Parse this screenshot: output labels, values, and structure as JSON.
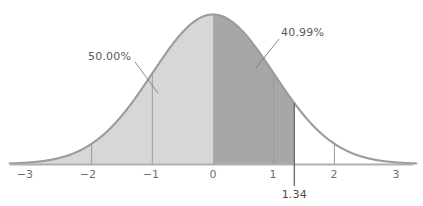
{
  "chart_data": {
    "type": "area",
    "title": "",
    "subtitle": "",
    "xlabel": "",
    "ylabel": "",
    "xlim": [
      -3.35,
      3.35
    ],
    "ylim": [
      0,
      0.4
    ],
    "grid": false,
    "legend": null,
    "distribution": "standard normal (z) curve, mean 0, sd 1",
    "x_ticks": [
      {
        "value": -3,
        "label": "−3"
      },
      {
        "value": -2,
        "label": "−2"
      },
      {
        "value": -1,
        "label": "−1"
      },
      {
        "value": 0,
        "label": "0"
      },
      {
        "value": 1,
        "label": "1"
      },
      {
        "value": 2,
        "label": "2"
      },
      {
        "value": 3,
        "label": "3"
      }
    ],
    "marked_value": {
      "value": 1.34,
      "label": "1.34"
    },
    "shaded_regions": [
      {
        "name": "left-half-region",
        "from": -3.35,
        "to": 0,
        "area_label": "50.00%",
        "color": "#d7d7d7"
      },
      {
        "name": "z-region",
        "from": 0,
        "to": 1.34,
        "area_label": "40.99%",
        "color": "#a7a7a7"
      }
    ],
    "annotations": [
      {
        "name": "left-area-annotation",
        "text": "50.00%",
        "label_x": 88,
        "label_y": 50,
        "leader_from": [
          135,
          62
        ],
        "leader_to": [
          158,
          93
        ]
      },
      {
        "name": "right-area-annotation",
        "text": "40.99%",
        "label_x": 281,
        "label_y": 26,
        "leader_from": [
          279,
          39
        ],
        "leader_to": [
          256,
          68
        ]
      }
    ],
    "vertical_markers": [
      -2,
      -1,
      1,
      1.34,
      2
    ],
    "colors": {
      "curve_stroke": "#9b9b9b",
      "axis_line": "#b0b0b0",
      "left_fill": "#d7d7d7",
      "right_fill": "#a7a7a7",
      "marker_line": "#9a9a9a",
      "marked_line": "#7a7a7a",
      "tick_text": "#6e6e6e",
      "annotation_text": "#5a5a5a",
      "background": "#ffffff"
    }
  },
  "axis": {
    "tick_labels": [
      "−3",
      "−2",
      "−1",
      "0",
      "1",
      "2",
      "3"
    ]
  },
  "labels": {
    "left_area": "50.00%",
    "right_area": "40.99%",
    "z_value": "1.34"
  }
}
